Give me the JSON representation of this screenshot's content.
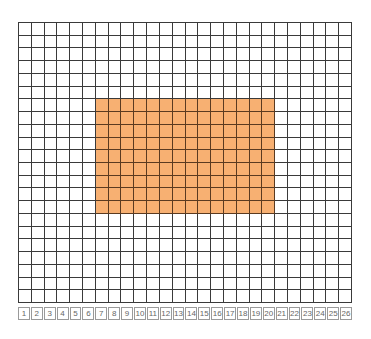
{
  "grid": {
    "columns": 26,
    "rows": 22,
    "cell_color": "#ffffff",
    "line_color": "#3a3a3a",
    "highlight": {
      "color": "#f7b072",
      "col_start": 7,
      "col_end": 20,
      "row_start": 7,
      "row_end": 15,
      "width_cells": 14,
      "height_cells": 9
    }
  },
  "column_labels": [
    "1",
    "2",
    "3",
    "4",
    "5",
    "6",
    "7",
    "8",
    "9",
    "10",
    "11",
    "12",
    "13",
    "14",
    "15",
    "16",
    "17",
    "18",
    "19",
    "20",
    "21",
    "22",
    "23",
    "24",
    "25",
    "26"
  ]
}
